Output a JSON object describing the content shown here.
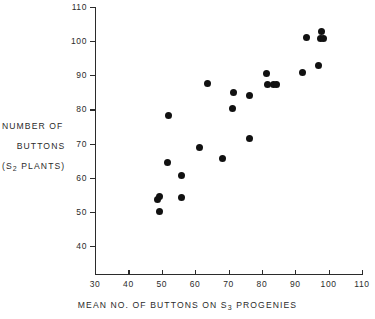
{
  "chart_data": {
    "type": "scatter",
    "title": "",
    "xlabel": "MEAN NO. OF BUTTONS ON S3 PROGENIES",
    "xlabel_parts": {
      "pre": "MEAN  NO. OF  BUTTONS ON  S",
      "sub": "3",
      "post": "  PROGENIES"
    },
    "ylabel": "NUMBER OF BUTTONS (S2 PLANTS)",
    "ylabel_lines": [
      "NUMBER  OF",
      "BUTTONS",
      "(S2  PLANTS)"
    ],
    "ylabel_parts": {
      "line1": "NUMBER  OF",
      "line2": "BUTTONS",
      "line3_pre": "(S",
      "line3_sub": "2",
      "line3_post": "  PLANTS)"
    },
    "xlim": [
      30,
      110
    ],
    "ylim": [
      30,
      110
    ],
    "xticks": [
      30,
      40,
      50,
      60,
      70,
      80,
      90,
      100,
      110
    ],
    "xtick_labels": [
      "30",
      "40",
      "50",
      "60",
      "70",
      "80",
      "90",
      "100",
      "110"
    ],
    "yticks": [
      40,
      50,
      60,
      70,
      80,
      90,
      100,
      110
    ],
    "ytick_labels": [
      "40",
      "50",
      "60",
      "70",
      "80",
      "90",
      "100",
      "110"
    ],
    "grid": false,
    "legend": false,
    "marker": {
      "shape": "circle",
      "color": "#111111",
      "size": 7
    },
    "n_points": 24,
    "points": [
      {
        "x": 48.8,
        "y": 53.7
      },
      {
        "x": 49.3,
        "y": 54.5
      },
      {
        "x": 49.4,
        "y": 50.0
      },
      {
        "x": 51.9,
        "y": 78.3
      },
      {
        "x": 51.8,
        "y": 64.5
      },
      {
        "x": 55.8,
        "y": 60.6
      },
      {
        "x": 55.9,
        "y": 54.3
      },
      {
        "x": 61.3,
        "y": 69.0
      },
      {
        "x": 63.8,
        "y": 87.6
      },
      {
        "x": 68.1,
        "y": 65.5
      },
      {
        "x": 71.2,
        "y": 80.3
      },
      {
        "x": 71.5,
        "y": 85.0
      },
      {
        "x": 76.2,
        "y": 84.0
      },
      {
        "x": 76.3,
        "y": 71.4
      },
      {
        "x": 81.4,
        "y": 90.4
      },
      {
        "x": 81.8,
        "y": 87.3
      },
      {
        "x": 83.6,
        "y": 87.3
      },
      {
        "x": 84.5,
        "y": 87.3
      },
      {
        "x": 92.1,
        "y": 90.8
      },
      {
        "x": 93.5,
        "y": 101.2
      },
      {
        "x": 96.9,
        "y": 93.0
      },
      {
        "x": 97.7,
        "y": 100.8
      },
      {
        "x": 98.0,
        "y": 102.8
      },
      {
        "x": 98.4,
        "y": 100.7
      }
    ]
  },
  "colors": {
    "marker": "#111111",
    "axis": "#2b2b2b",
    "background": "#ffffff"
  }
}
